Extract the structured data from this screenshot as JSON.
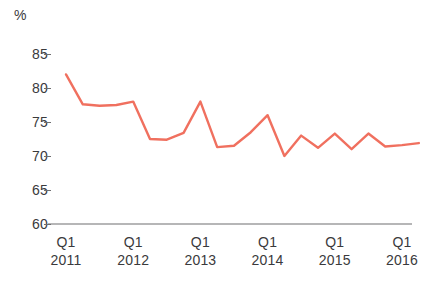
{
  "chart_data": {
    "type": "line",
    "title": "",
    "xlabel": "",
    "ylabel": "%",
    "unit_label": "%",
    "ylim": [
      60,
      85
    ],
    "ytick_values": [
      85,
      80,
      75,
      70,
      65,
      60
    ],
    "ytick_labels": [
      "85",
      "80",
      "75",
      "70",
      "65",
      "60"
    ],
    "grid": false,
    "legend": "none",
    "line_color": "#f0705f",
    "axis_color": "#6e6e70",
    "text_color": "#3a3a3c",
    "xtick_labels": [
      {
        "quarter": "Q1",
        "year": "2011"
      },
      {
        "quarter": "Q1",
        "year": "2012"
      },
      {
        "quarter": "Q1",
        "year": "2013"
      },
      {
        "quarter": "Q1",
        "year": "2014"
      },
      {
        "quarter": "Q1",
        "year": "2015"
      },
      {
        "quarter": "Q1",
        "year": "2016"
      }
    ],
    "x": [
      "Q1 2011",
      "Q2 2011",
      "Q3 2011",
      "Q4 2011",
      "Q1 2012",
      "Q2 2012",
      "Q3 2012",
      "Q4 2012",
      "Q1 2013",
      "Q2 2013",
      "Q3 2013",
      "Q4 2013",
      "Q1 2014",
      "Q2 2014",
      "Q3 2014",
      "Q4 2014",
      "Q1 2015",
      "Q2 2015",
      "Q3 2015",
      "Q4 2015",
      "Q1 2016",
      "Q2 2016"
    ],
    "values": [
      82.0,
      77.6,
      77.4,
      77.5,
      78.0,
      72.5,
      72.4,
      73.4,
      78.0,
      71.3,
      71.5,
      73.5,
      76.0,
      70.0,
      73.0,
      71.2,
      73.3,
      71.0,
      73.3,
      71.4,
      71.6,
      71.9
    ]
  }
}
